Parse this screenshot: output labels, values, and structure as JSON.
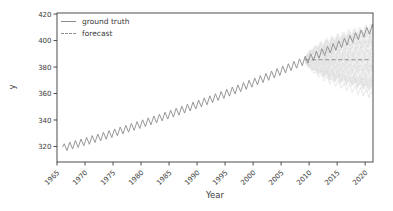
{
  "chart_data": {
    "type": "line",
    "title": "",
    "xlabel": "Year",
    "ylabel": "y",
    "xlim": [
      1965,
      2021.4
    ],
    "ylim": [
      308.3,
      420.8
    ],
    "x_ticks": [
      1965,
      1970,
      1975,
      1980,
      1985,
      1990,
      1995,
      2000,
      2005,
      2010,
      2015,
      2020
    ],
    "y_ticks": [
      320,
      340,
      360,
      380,
      400,
      420
    ],
    "grid": false,
    "legend": {
      "position": "upper-left",
      "entries": [
        {
          "label": "ground truth",
          "line_style": "solid"
        },
        {
          "label": "forecast",
          "line_style": "dashed"
        }
      ]
    },
    "series": [
      {
        "name": "ground truth",
        "line_style": "solid",
        "color": "#8c8c8c",
        "seasonal_amplitude": 2.6,
        "seasonal_period_years": 1,
        "years": [
          1966,
          1967,
          1968,
          1969,
          1970,
          1971,
          1972,
          1973,
          1974,
          1975,
          1976,
          1977,
          1978,
          1979,
          1980,
          1981,
          1982,
          1983,
          1984,
          1985,
          1986,
          1987,
          1988,
          1989,
          1990,
          1991,
          1992,
          1993,
          1994,
          1995,
          1996,
          1997,
          1998,
          1999,
          2000,
          2001,
          2002,
          2003,
          2004,
          2005,
          2006,
          2007,
          2008,
          2009,
          2010,
          2011,
          2012,
          2013,
          2014,
          2015,
          2016,
          2017,
          2018,
          2019,
          2020,
          2021
        ],
        "annual_mean_values": [
          319.5,
          320.7,
          321.9,
          323.1,
          324.3,
          325.6,
          326.8,
          328.1,
          329.4,
          330.7,
          332.1,
          333.4,
          334.8,
          336.2,
          337.6,
          339.0,
          340.4,
          341.9,
          343.3,
          344.8,
          346.3,
          347.8,
          349.4,
          350.9,
          352.5,
          354.1,
          355.7,
          357.3,
          358.9,
          360.6,
          362.3,
          363.9,
          365.7,
          367.4,
          369.1,
          370.9,
          372.6,
          374.4,
          376.2,
          378.1,
          379.9,
          381.7,
          383.6,
          385.5,
          387.4,
          389.3,
          391.3,
          393.2,
          395.2,
          397.2,
          399.2,
          401.2,
          403.3,
          405.3,
          407.4,
          409.5
        ]
      },
      {
        "name": "forecast",
        "line_style": "dashed",
        "color": "#909090",
        "x_start": 2009.3,
        "x_end": 2020.9,
        "value": 385.5
      }
    ],
    "uncertainty_fan": {
      "color": "#d9d9d9",
      "x_start": 2009.3,
      "x_end": 2021.35,
      "center": 385.5,
      "spread_at_end": 26,
      "growth": "sqrt",
      "n_paths": 60
    }
  },
  "style": {
    "axis_color": "#3a3a3a",
    "text_color": "#3a3a3a",
    "background": "#ffffff"
  }
}
